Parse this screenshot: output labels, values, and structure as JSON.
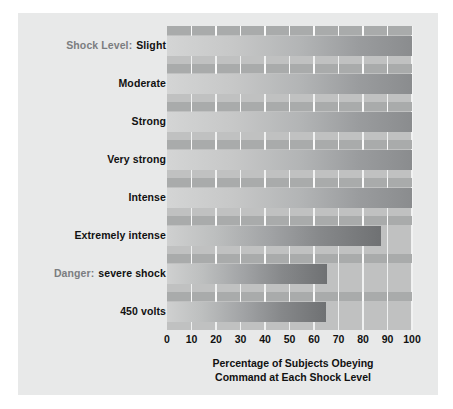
{
  "chart_data": {
    "type": "bar",
    "orientation": "horizontal",
    "title": "",
    "xlabel_lines": [
      "Percentage of Subjects Obeying",
      "Command at Each Shock Level"
    ],
    "ylabel": "Shock Level:",
    "categories": [
      "Slight",
      "Moderate",
      "Strong",
      "Very strong",
      "Intense",
      "Extremely intense",
      "Danger: severe shock",
      "450 volts"
    ],
    "category_prefixes": [
      "Shock Level:",
      "",
      "",
      "",
      "",
      "",
      "Danger:",
      ""
    ],
    "category_main": [
      "Slight",
      "Moderate",
      "Strong",
      "Very strong",
      "Intense",
      "Extremely intense",
      "severe shock",
      "450 volts"
    ],
    "values": [
      100,
      100,
      100,
      100,
      100,
      87.5,
      65.5,
      65
    ],
    "xlim": [
      0,
      100
    ],
    "xticks": [
      0,
      10,
      20,
      30,
      40,
      50,
      60,
      70,
      80,
      90,
      100
    ],
    "xtick_labels": [
      "0",
      "10",
      "20",
      "30",
      "40",
      "50",
      "60",
      "70",
      "80",
      "90",
      "100"
    ],
    "grid": true,
    "legend": "none",
    "colors": {
      "figure_background": "#ffffff",
      "panel_background": "#e8e9e9",
      "plot_background": "#c0c1c1",
      "gridline": "#f2f3f3",
      "tick_band": "#a9abab",
      "bar_gradient_start": "#d2d3d3",
      "bar_gradient_end": "#7d7f81",
      "label_text": "#111111",
      "prefix_text": "#7b7d80"
    }
  }
}
